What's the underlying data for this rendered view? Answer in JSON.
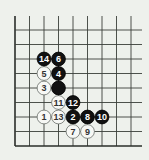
{
  "board": {
    "background": "#eef1ec",
    "line_color": "#3a3f3a",
    "edge_color": "#2a2e2a",
    "origin": {
      "x": 15,
      "y": 146
    },
    "spacing": 14.5,
    "cols": 9,
    "rows": 9,
    "top_y": 16,
    "right_x": 142,
    "edges": [
      "left",
      "bottom"
    ]
  },
  "stones": [
    {
      "move": "1",
      "color": "white",
      "col": 2,
      "row": 2
    },
    {
      "move": "2",
      "color": "black",
      "col": 4,
      "row": 2
    },
    {
      "move": "3",
      "color": "white",
      "col": 2,
      "row": 4
    },
    {
      "move": "4",
      "color": "black",
      "col": 3,
      "row": 5
    },
    {
      "move": "5",
      "color": "white",
      "col": 2,
      "row": 5
    },
    {
      "move": "6",
      "color": "black",
      "col": 3,
      "row": 6
    },
    {
      "move": "7",
      "color": "white",
      "col": 4,
      "row": 1
    },
    {
      "move": "8",
      "color": "black",
      "col": 5,
      "row": 2
    },
    {
      "move": "9",
      "color": "white",
      "col": 5,
      "row": 1
    },
    {
      "move": "10",
      "color": "black",
      "col": 6,
      "row": 2
    },
    {
      "move": "11",
      "color": "white",
      "col": 3,
      "row": 3
    },
    {
      "move": "12",
      "color": "black",
      "col": 4,
      "row": 3
    },
    {
      "move": "13",
      "color": "white",
      "col": 3,
      "row": 2
    },
    {
      "move": "14",
      "color": "black",
      "col": 2,
      "row": 6
    },
    {
      "move": "",
      "color": "black",
      "col": 3,
      "row": 4
    }
  ]
}
